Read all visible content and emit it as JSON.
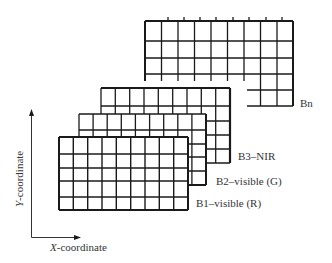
{
  "diagram": {
    "type": "multispectral image band stack",
    "bands": [
      {
        "id": "bn",
        "label": "Bn",
        "cols": 9,
        "rows": 5
      },
      {
        "id": "b3",
        "label": "B3–NIR",
        "cols": 9,
        "rows": 5
      },
      {
        "id": "b2",
        "label": "B2–visible (G)",
        "cols": 9,
        "rows": 5
      },
      {
        "id": "b1",
        "label": "B1–visible (R)",
        "cols": 9,
        "rows": 5
      }
    ],
    "axes": {
      "x_label_var": "X",
      "x_label_rest": "-coordinate",
      "y_label_var": "Y",
      "y_label_rest": "-coordinate"
    },
    "colors": {
      "line": "#1a1a1a",
      "text": "#333333",
      "background": "#ffffff"
    }
  }
}
